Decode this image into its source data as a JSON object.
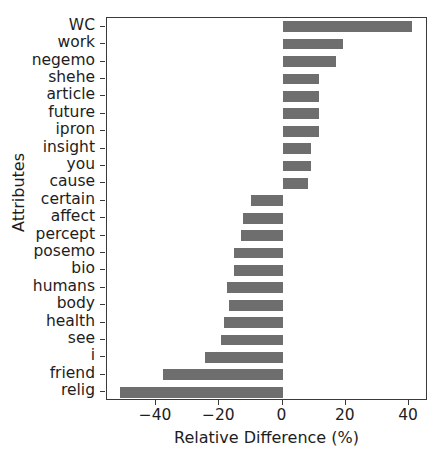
{
  "chart_data": {
    "type": "bar",
    "orientation": "horizontal",
    "title": "",
    "xlabel": "Relative Difference (%)",
    "ylabel": "Attributes",
    "xlim": [
      -55.5,
      46.0
    ],
    "xticks": [
      -40,
      -20,
      0,
      20,
      40
    ],
    "xtick_labels": [
      "−40",
      "−20",
      "0",
      "20",
      "40"
    ],
    "grid": false,
    "legend": null,
    "bar_color": "#6e6e6e",
    "axis_color": "#3a3a3a",
    "categories": [
      "WC",
      "work",
      "negemo",
      "shehe",
      "article",
      "future",
      "ipron",
      "insight",
      "you",
      "cause",
      "certain",
      "affect",
      "percept",
      "posemo",
      "bio",
      "humans",
      "body",
      "health",
      "see",
      "i",
      "friend",
      "relig"
    ],
    "values": [
      41.0,
      19.0,
      17.0,
      11.5,
      11.5,
      11.5,
      11.5,
      9.0,
      9.0,
      8.0,
      -10.0,
      -12.5,
      -13.0,
      -15.5,
      -15.5,
      -17.5,
      -17.0,
      -18.5,
      -19.5,
      -24.5,
      -37.8,
      -51.5
    ]
  },
  "axes": {
    "xaxis_title": "Relative Difference (%)",
    "yaxis_title": "Attributes"
  }
}
